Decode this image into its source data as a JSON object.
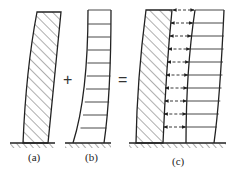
{
  "diagram": {
    "colors": {
      "stroke": "#222222",
      "hatch": "#333333",
      "background": "#ffffff"
    },
    "operators": {
      "plus": "+",
      "equals": "="
    },
    "panels": [
      {
        "id": "a",
        "label": "(a)",
        "type": "hatched-column-bending"
      },
      {
        "id": "b",
        "label": "(b)",
        "type": "frame-shear-deformation"
      },
      {
        "id": "c",
        "label": "(c)",
        "type": "combined-wall-frame-with-interaction-forces"
      }
    ]
  }
}
